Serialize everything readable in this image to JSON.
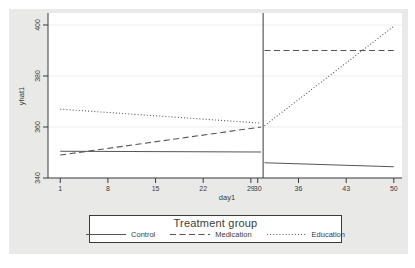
{
  "figure": {
    "background": "#e9e9e7",
    "plot_background": "#ffffff",
    "grid_color": "#e9eef2",
    "axis_color": "#3a3a3a",
    "text_color": "#3b3b3b",
    "series_color": "#565656",
    "vline_color": "#3a3a3a",
    "legend_border": "#3a3a3a"
  },
  "chart_data": {
    "type": "line",
    "title": "",
    "xlabel": "day1",
    "ylabel": "yhat1",
    "xlim": [
      -0.8,
      51.2
    ],
    "ylim": [
      340,
      404.7
    ],
    "x_ticks": [
      1,
      8,
      15,
      22,
      29,
      30,
      36,
      43,
      50
    ],
    "y_ticks": [
      340,
      360,
      380,
      400
    ],
    "grid": true,
    "vline_x": 30.8,
    "series": [
      {
        "name": "Control",
        "style": "solid",
        "segments": [
          {
            "x": [
              1,
              30.5
            ],
            "y": [
              350.5,
              350.2
            ]
          },
          {
            "x": [
              31,
              50
            ],
            "y": [
              346.0,
              344.4
            ]
          }
        ]
      },
      {
        "name": "Medication",
        "style": "dashed",
        "segments": [
          {
            "x": [
              1,
              30.5
            ],
            "y": [
              349.0,
              360.0
            ]
          },
          {
            "x": [
              31,
              50
            ],
            "y": [
              390.0,
              390.0
            ]
          }
        ]
      },
      {
        "name": "Education",
        "style": "dotted",
        "segments": [
          {
            "x": [
              1,
              30.5
            ],
            "y": [
              367.0,
              361.5
            ]
          },
          {
            "x": [
              31,
              50
            ],
            "y": [
              360.5,
              399.5
            ]
          }
        ]
      }
    ],
    "legend": {
      "title": "Treatment group",
      "position": "bottom",
      "entries": [
        {
          "label": "Control",
          "style": "solid"
        },
        {
          "label": "Medication",
          "style": "dashed"
        },
        {
          "label": "Education",
          "style": "dotted"
        }
      ]
    }
  }
}
